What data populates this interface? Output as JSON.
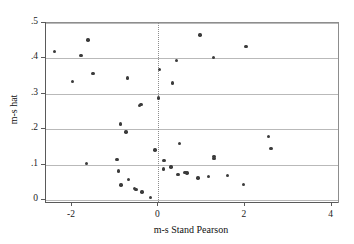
{
  "chart_data": {
    "type": "scatter",
    "title": "",
    "xlabel": "m-s Stand Pearson",
    "ylabel": "m-s hat",
    "xlim": [
      -2.6,
      4.15
    ],
    "ylim": [
      -0.005,
      0.5
    ],
    "xticks": [
      -2,
      0,
      2,
      4
    ],
    "xticklabels": [
      "-2",
      "0",
      "2",
      "4"
    ],
    "yticks": [
      0,
      0.1,
      0.2,
      0.3,
      0.4,
      0.5
    ],
    "yticklabels": [
      "0",
      ".1",
      ".2",
      ".3",
      ".4",
      ".5"
    ],
    "grid": "horizontal",
    "reference_line_x": 0,
    "legend": null,
    "marker_color": "#3b3b3b",
    "grid_color": "#b9b9b9",
    "frame_color": "#8d8d8d",
    "points": [
      {
        "x": -2.41,
        "y": 0.419
      },
      {
        "x": -1.99,
        "y": 0.335
      },
      {
        "x": -1.79,
        "y": 0.408
      },
      {
        "x": -1.63,
        "y": 0.452
      },
      {
        "x": -1.66,
        "y": 0.104
      },
      {
        "x": -1.51,
        "y": 0.358
      },
      {
        "x": -0.96,
        "y": 0.115
      },
      {
        "x": -0.92,
        "y": 0.082
      },
      {
        "x": -0.88,
        "y": 0.215
      },
      {
        "x": -0.87,
        "y": 0.043
      },
      {
        "x": -0.75,
        "y": 0.192
      },
      {
        "x": -0.72,
        "y": 0.345
      },
      {
        "x": -0.7,
        "y": 0.058
      },
      {
        "x": -0.56,
        "y": 0.033
      },
      {
        "x": -0.52,
        "y": 0.031
      },
      {
        "x": -0.44,
        "y": 0.268
      },
      {
        "x": -0.4,
        "y": 0.27
      },
      {
        "x": -0.38,
        "y": 0.023
      },
      {
        "x": -0.19,
        "y": 0.007
      },
      {
        "x": -0.08,
        "y": 0.142
      },
      {
        "x": 0.0,
        "y": 0.288
      },
      {
        "x": 0.02,
        "y": 0.369
      },
      {
        "x": 0.13,
        "y": 0.112
      },
      {
        "x": 0.12,
        "y": 0.088
      },
      {
        "x": 0.29,
        "y": 0.094
      },
      {
        "x": 0.33,
        "y": 0.331
      },
      {
        "x": 0.41,
        "y": 0.394
      },
      {
        "x": 0.45,
        "y": 0.072
      },
      {
        "x": 0.49,
        "y": 0.16
      },
      {
        "x": 0.61,
        "y": 0.079
      },
      {
        "x": 0.66,
        "y": 0.077
      },
      {
        "x": 0.91,
        "y": 0.063
      },
      {
        "x": 0.96,
        "y": 0.466
      },
      {
        "x": 1.15,
        "y": 0.067
      },
      {
        "x": 1.27,
        "y": 0.403
      },
      {
        "x": 1.28,
        "y": 0.124
      },
      {
        "x": 1.28,
        "y": 0.117
      },
      {
        "x": 1.6,
        "y": 0.069
      },
      {
        "x": 1.97,
        "y": 0.045
      },
      {
        "x": 2.02,
        "y": 0.433
      },
      {
        "x": 2.55,
        "y": 0.179
      },
      {
        "x": 2.6,
        "y": 0.146
      }
    ]
  }
}
